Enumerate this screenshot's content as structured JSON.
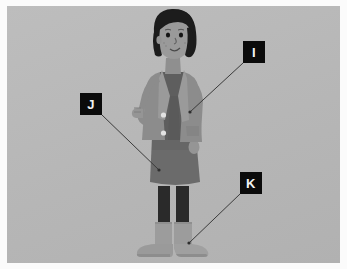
{
  "image": {
    "title": "Labelled illustration of a girl standing",
    "width": 347,
    "height": 269,
    "border_color": "#fbfbfb",
    "panel_color": "#b9b9b9",
    "style": "grayscale cartoon illustration"
  },
  "annotations": {
    "box_fill": "#0b0b0b",
    "box_text_color": "#f2f2f2",
    "leader_line_color": "#3b3b3b",
    "labels": [
      {
        "id": "I",
        "text": "I",
        "box": {
          "x": 243,
          "y": 41,
          "w": 22,
          "h": 22
        },
        "leader_from": {
          "x": 243,
          "y": 63
        },
        "leader_to": {
          "x": 190,
          "y": 112
        },
        "points_at": "cardigan"
      },
      {
        "id": "J",
        "text": "J",
        "box": {
          "x": 80,
          "y": 93,
          "w": 22,
          "h": 22
        },
        "leader_from": {
          "x": 102,
          "y": 115
        },
        "leader_to": {
          "x": 159,
          "y": 170
        },
        "points_at": "skirt"
      },
      {
        "id": "K",
        "text": "K",
        "box": {
          "x": 240,
          "y": 172,
          "w": 22,
          "h": 22
        },
        "leader_from": {
          "x": 240,
          "y": 194
        },
        "leader_to": {
          "x": 189,
          "y": 243
        },
        "points_at": "boot"
      }
    ]
  },
  "figure": {
    "name": "girl-illustration",
    "parts": [
      {
        "name": "hair",
        "color": "#1c1c1c"
      },
      {
        "name": "face",
        "color": "#9a9a9a"
      },
      {
        "name": "neck",
        "color": "#8f8f8f"
      },
      {
        "name": "cardigan",
        "color": "#8c8c8c"
      },
      {
        "name": "inner-top",
        "color": "#5e5e5e"
      },
      {
        "name": "skirt",
        "color": "#6b6b6b"
      },
      {
        "name": "leggings",
        "color": "#2a2a2a"
      },
      {
        "name": "boots",
        "color": "#9c9c9c"
      },
      {
        "name": "buttons",
        "color": "#e2e2e2"
      },
      {
        "name": "hands",
        "color": "#959595"
      }
    ]
  }
}
